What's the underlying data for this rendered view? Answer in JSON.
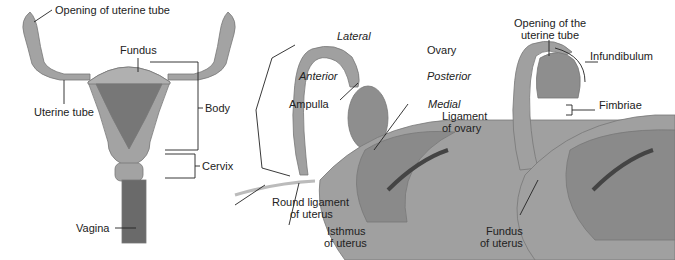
{
  "panels": {
    "left": {
      "labels": {
        "opening": "Opening of uterine tube",
        "fundus": "Fundus",
        "uterine_tube": "Uterine tube",
        "body": "Body",
        "cervix": "Cervix",
        "vagina": "Vagina"
      }
    },
    "middle": {
      "labels": {
        "lateral": "Lateral",
        "anterior": "Anterior",
        "ampulla": "Ampulla",
        "ovary": "Ovary",
        "posterior": "Posterior",
        "medial": "Medial",
        "ligament_ovary_1": "Ligament",
        "ligament_ovary_2": "of ovary",
        "round_lig_1": "Round ligament",
        "round_lig_2": "of uterus",
        "isthmus_1": "Isthmus",
        "isthmus_2": "of uterus"
      }
    },
    "right": {
      "labels": {
        "opening_1": "Opening of the",
        "opening_2": "uterine tube",
        "infundibulum": "Infundibulum",
        "fimbriae": "Fimbriae",
        "fundus_1": "Fundus",
        "fundus_2": "of uterus"
      }
    }
  },
  "colors": {
    "tissue": "#9a9a9a",
    "dark": "#6e6e6e",
    "line": "#222222"
  }
}
